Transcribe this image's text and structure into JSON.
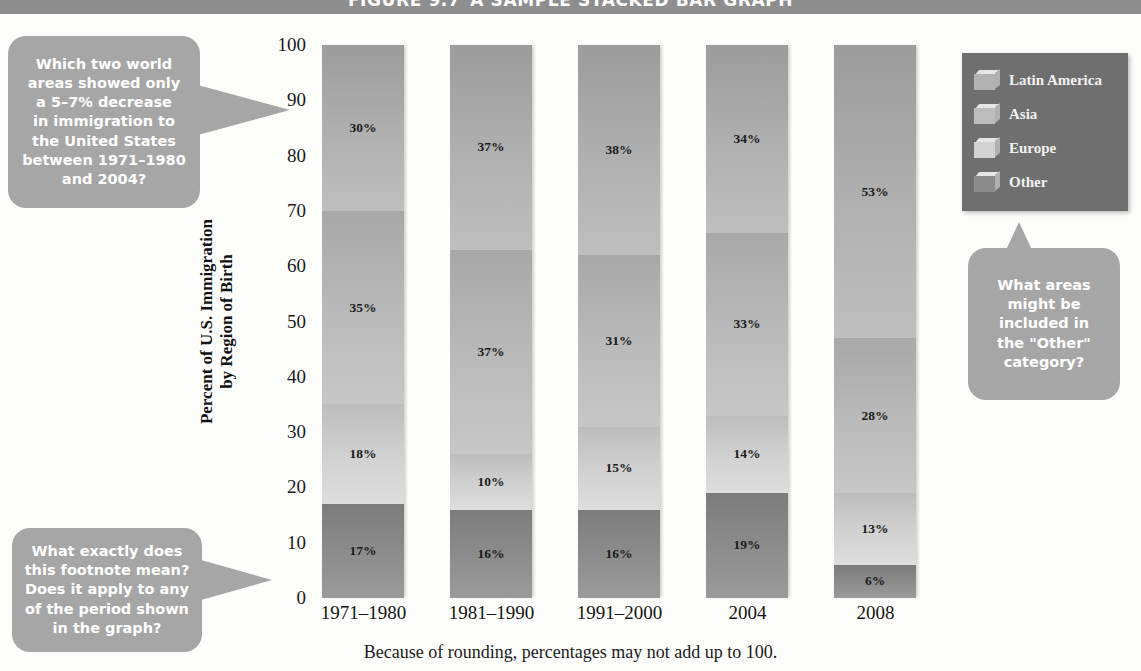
{
  "figure": {
    "number": "FIGURE 9.7",
    "title": "A SAMPLE STACKED BAR GRAPH",
    "title_bar_color": "#8e8e8e"
  },
  "footnote": "Because of rounding, percentages may not add up to 100.",
  "legend": {
    "background_color": "#6f6f6f",
    "items": [
      {
        "label": "Latin America",
        "color": "#b2b2b2"
      },
      {
        "label": "Asia",
        "color": "#bcbcbc"
      },
      {
        "label": "Europe",
        "color": "#d2d2d2"
      },
      {
        "label": "Other",
        "color": "#8d8d8d"
      }
    ]
  },
  "callouts": [
    {
      "name": "callout-top",
      "lines": [
        "Which two world",
        "areas showed only",
        "a 5–7% decrease",
        "in immigration to",
        "the United States",
        "between 1971–1980",
        "and 2004?"
      ]
    },
    {
      "name": "callout-bottom",
      "lines": [
        "What exactly does",
        "this footnote mean?",
        "Does it apply to any",
        "of the period shown",
        "in the graph?"
      ]
    },
    {
      "name": "callout-right",
      "lines": [
        "What areas",
        "might be",
        "included in",
        "the \"Other\"",
        "category?"
      ]
    }
  ],
  "chart_data": {
    "type": "bar",
    "stacked": true,
    "title": "A SAMPLE STACKED BAR GRAPH",
    "xlabel": "",
    "ylabel": "Percent of U.S. Immigration by Region of Birth",
    "ylabel_lines": [
      "Percent of U.S. Immigration",
      "by Region of Birth"
    ],
    "ylim": [
      0,
      100
    ],
    "yticks": [
      0,
      10,
      20,
      30,
      40,
      50,
      60,
      70,
      80,
      90,
      100
    ],
    "ytick_labels": [
      "0",
      "10",
      "20",
      "30",
      "40",
      "50",
      "60",
      "70",
      "80",
      "90",
      "100"
    ],
    "grid": false,
    "legend_position": "right",
    "categories": [
      "1971–1980",
      "1981–1990",
      "1991–2000",
      "2004",
      "2008"
    ],
    "series": [
      {
        "name": "Other",
        "values": [
          17,
          16,
          16,
          19,
          6
        ],
        "labels": [
          "17%",
          "16%",
          "16%",
          "19%",
          "6%"
        ],
        "color": "#8d8d8d"
      },
      {
        "name": "Europe",
        "values": [
          18,
          10,
          15,
          14,
          13
        ],
        "labels": [
          "18%",
          "10%",
          "15%",
          "14%",
          "13%"
        ],
        "color": "#d2d2d2"
      },
      {
        "name": "Asia",
        "values": [
          35,
          37,
          31,
          33,
          28
        ],
        "labels": [
          "35%",
          "37%",
          "31%",
          "33%",
          "28%"
        ],
        "color": "#bcbcbc"
      },
      {
        "name": "Latin America",
        "values": [
          30,
          37,
          38,
          34,
          53
        ],
        "labels": [
          "30%",
          "37%",
          "38%",
          "34%",
          "53%"
        ],
        "color": "#b2b2b2"
      }
    ]
  }
}
